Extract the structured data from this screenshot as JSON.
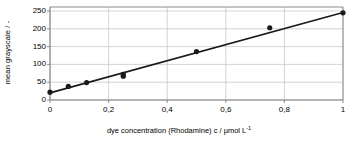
{
  "chart_data": {
    "type": "scatter",
    "title": "",
    "xlabel": "dye concentration (Rhodamine) c / µmol L",
    "xlabel_exponent": "-1",
    "ylabel": "mean grayscale / -",
    "xlim": [
      0,
      1
    ],
    "ylim": [
      0,
      250
    ],
    "grid": true,
    "legend": false,
    "xticks": [
      0,
      0.2,
      0.4,
      0.6,
      0.8,
      1
    ],
    "xticklabels": [
      "0",
      "0,2",
      "0,4",
      "0,6",
      "0,8",
      "1"
    ],
    "yticks": [
      0,
      50,
      100,
      150,
      200,
      250
    ],
    "yticklabels": [
      "0",
      "50",
      "100",
      "150",
      "200",
      "250"
    ],
    "marker_color": "#1a1a1a",
    "line_color": "#1a1a1a",
    "grid_color": "#c8c8c8",
    "axis_color": "#808080",
    "points": [
      {
        "x": 0.0,
        "y": 22
      },
      {
        "x": 0.0625,
        "y": 38
      },
      {
        "x": 0.125,
        "y": 49
      },
      {
        "x": 0.25,
        "y": 67
      },
      {
        "x": 0.25,
        "y": 72
      },
      {
        "x": 0.5,
        "y": 136
      },
      {
        "x": 0.75,
        "y": 203
      },
      {
        "x": 1.0,
        "y": 245
      }
    ],
    "fit_line": {
      "x": [
        0,
        1
      ],
      "y": [
        20,
        246
      ]
    }
  }
}
